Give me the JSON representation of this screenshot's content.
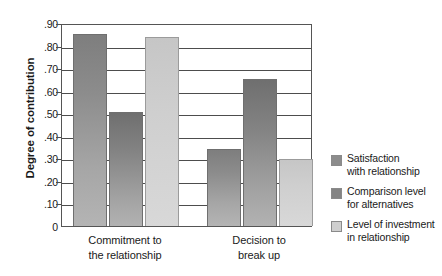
{
  "chart_data": {
    "type": "bar",
    "title": "",
    "xlabel": "",
    "ylabel": "Degree of contribution",
    "ylim": [
      0,
      0.9
    ],
    "grid": true,
    "legend_position": "right",
    "categories": [
      "Commitment to\nthe relationship",
      "Decision to\nbreak up"
    ],
    "ytick_labels": [
      "0",
      ".10",
      ".20",
      ".30",
      ".40",
      ".50",
      ".60",
      ".70",
      ".80",
      ".90"
    ],
    "ytick_values": [
      0,
      0.1,
      0.2,
      0.3,
      0.4,
      0.5,
      0.6,
      0.7,
      0.8,
      0.9
    ],
    "series": [
      {
        "name": "Satisfaction\nwith relationship",
        "color": "#8c8c8c",
        "values": [
          0.85,
          0.34
        ]
      },
      {
        "name": "Comparison level\nfor alternatives",
        "color": "#848484",
        "values": [
          0.505,
          0.65
        ]
      },
      {
        "name": "Level of investment\nin relationship",
        "color": "#cfcfcf",
        "values": [
          0.84,
          0.295
        ]
      }
    ]
  },
  "axis": {
    "y_title": "Degree of contribution"
  }
}
